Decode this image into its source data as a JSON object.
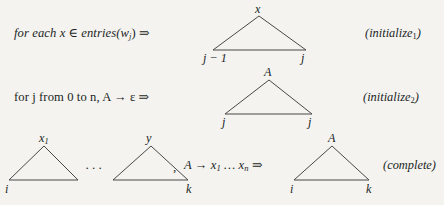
{
  "page": {
    "background_color": "#f4f3f0",
    "ink_color": "#211f1e",
    "line_color": "#4b4846"
  },
  "rules": [
    {
      "id": "initialize-1",
      "premise_text": "for each x ∈ entries(w",
      "premise_sub": "j",
      "premise_tail": ") ⇒",
      "tag": "(initialize",
      "tag_sub": "1",
      "tag_tail": ")",
      "triangles": [
        {
          "id": "tri-initialize-1",
          "apex_label": "x",
          "left_label": "j − 1",
          "right_label": "j"
        }
      ]
    },
    {
      "id": "initialize-2",
      "premise_text": "for j from 0 to n, A → ε ⇒",
      "tag": "(initialize",
      "tag_sub": "2",
      "tag_tail": ")",
      "triangles": [
        {
          "id": "tri-initialize-2",
          "apex_label": "A",
          "left_label": "j",
          "right_label": "j"
        }
      ]
    },
    {
      "id": "complete",
      "separator_dots": "···",
      "comma": ",",
      "production_head": "A → x",
      "production_head_sub": "1",
      "production_mid": " … x",
      "production_tail_sub": "n",
      "production_arrow": " ⇒",
      "tag": "(complete",
      "tag_sub": "",
      "tag_tail": ")",
      "triangles": [
        {
          "id": "tri-complete-x1",
          "apex_label": "x",
          "apex_sub": "1",
          "left_label": "i",
          "right_label": ""
        },
        {
          "id": "tri-complete-y",
          "apex_label": "y",
          "left_label": "",
          "right_label": "k"
        },
        {
          "id": "tri-complete-A",
          "apex_label": "A",
          "left_label": "i",
          "right_label": "k"
        }
      ]
    }
  ]
}
